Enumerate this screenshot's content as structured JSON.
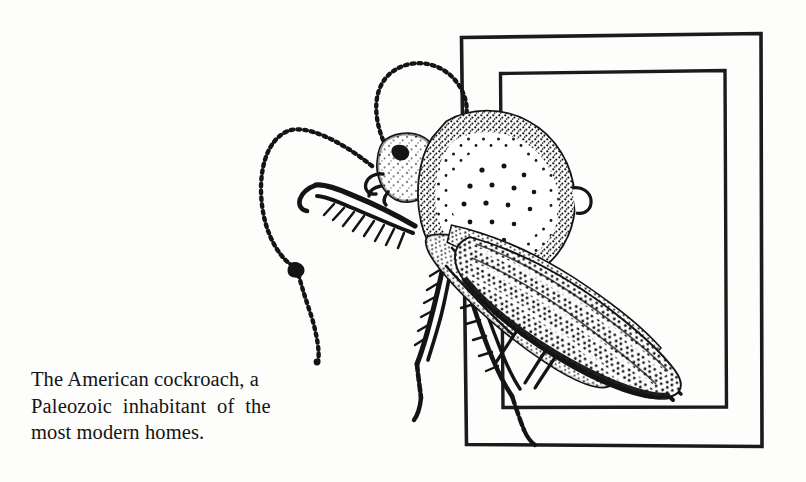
{
  "page": {
    "background_color": "#fdfdfc",
    "ink_color": "#141414",
    "width": 806,
    "height": 482
  },
  "caption": {
    "full_text": "The American cockroach, a Paleozoic inhabitant of the most modern homes.",
    "lines": [
      "The American cockroach, a",
      "Paleozoic  inhabitant  of  the",
      "most modern homes."
    ],
    "line1": "The American cockroach, a",
    "line2": "Paleozoic  inhabitant  of  the",
    "line3": "most modern homes."
  },
  "illustration": {
    "subject": "american-cockroach",
    "style": "stippled pen-and-ink line drawing",
    "description": "A side-angled American cockroach drawn in stipple, overlapping two nested rectangular picture frames",
    "parts": [
      "left-antenna",
      "right-antenna",
      "head",
      "pronotum",
      "forewing",
      "foreleg",
      "midleg",
      "hindleg",
      "cerci"
    ],
    "frames": [
      {
        "name": "outer-frame",
        "x": 461,
        "y": 36,
        "width": 301,
        "height": 411
      },
      {
        "name": "inner-frame",
        "x": 500,
        "y": 72,
        "width": 225,
        "height": 336
      }
    ]
  }
}
